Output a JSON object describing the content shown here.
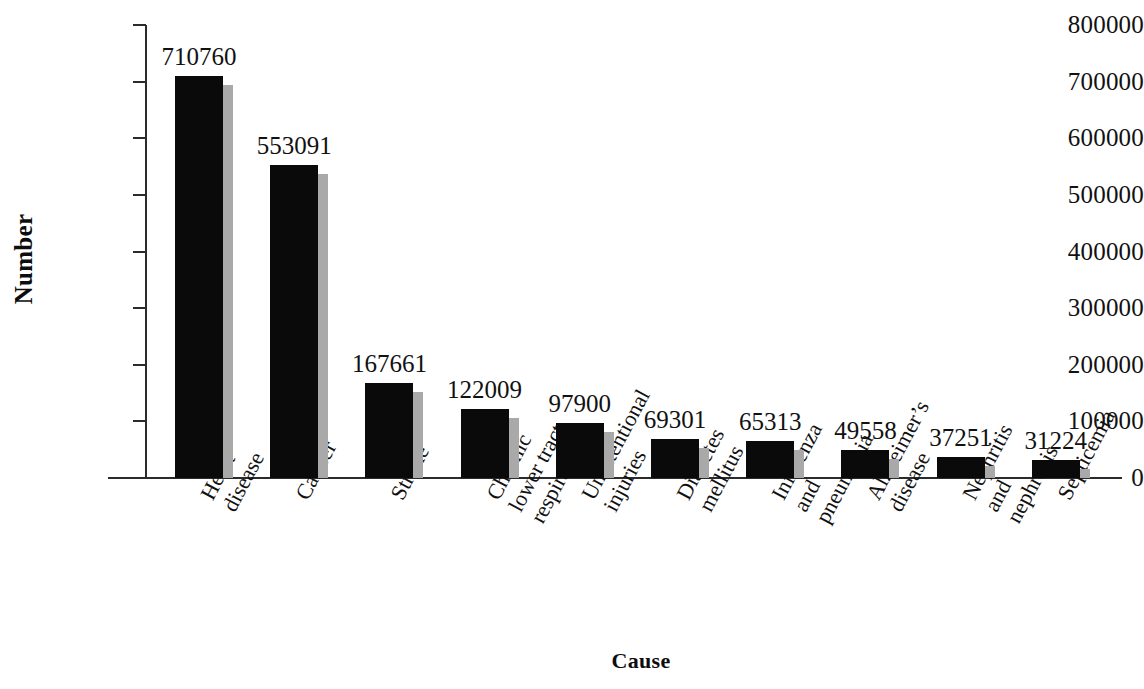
{
  "chart_data": {
    "type": "bar",
    "title": "",
    "xlabel": "Cause",
    "ylabel": "Number",
    "ylim": [
      0,
      800000
    ],
    "yticks": [
      800000,
      700000,
      600000,
      500000,
      400000,
      300000,
      200000,
      100000,
      0
    ],
    "ytick_labels": [
      "800000",
      "700000",
      "600000",
      "500000",
      "400000",
      "300000",
      "200000",
      "100000",
      "0"
    ],
    "grid": false,
    "legend": "none",
    "bar_style": "3d-black-front-gray-side",
    "colors": {
      "bar_face": "#0a0a0a",
      "bar_side": "#a9a9a9",
      "axis": "#2b2b2b",
      "text": "#111111"
    },
    "categories": [
      "Heart disease",
      "Cancer",
      "Stroke",
      "Chronic lower tract respiratory",
      "Unintentional injuries",
      "Diabetes mellitus",
      "Influenza and pneumonia",
      "Alzheimer's disease",
      "Nephritis and nephrosis",
      "Septicemia"
    ],
    "category_label_lines": [
      [
        "Heart",
        "disease"
      ],
      [
        "Cancer"
      ],
      [
        "Stroke"
      ],
      [
        "Chronic",
        "lower tract",
        "respiratory"
      ],
      [
        "Unintentional",
        "injuries"
      ],
      [
        "Diabetes",
        "mellitus"
      ],
      [
        "Influenza",
        "and",
        "pneumonia"
      ],
      [
        "Alzheimer’s",
        "disease"
      ],
      [
        "Nephritis",
        "and",
        "nephrosis"
      ],
      [
        "Septicemia"
      ]
    ],
    "values": [
      710760,
      553091,
      167661,
      122009,
      97900,
      69301,
      65313,
      49558,
      37251,
      31224
    ],
    "value_labels": [
      "710760",
      "553091",
      "167661",
      "122009",
      "97900",
      "69301",
      "65313",
      "49558",
      "37251",
      "31224"
    ]
  }
}
